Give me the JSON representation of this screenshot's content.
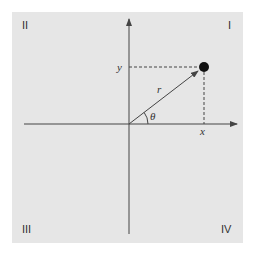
{
  "figure": {
    "background_color": "#e6e6e6",
    "page_color": "#ffffff",
    "line_color": "#444444",
    "dot_color": "#111111"
  },
  "quadrants": {
    "I": "I",
    "II": "II",
    "III": "III",
    "IV": "IV"
  },
  "labels": {
    "x": "x",
    "y": "y",
    "r": "r",
    "theta": "θ"
  },
  "point": {
    "description": "point at polar coordinates (r, θ) in quadrant I"
  }
}
